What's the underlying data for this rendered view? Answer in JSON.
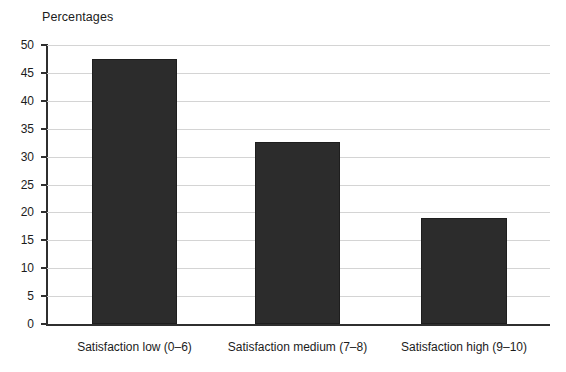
{
  "chart_data": {
    "type": "bar",
    "title": "Percentages",
    "xlabel": "",
    "ylabel": "",
    "categories": [
      "Satisfaction low (0–6)",
      "Satisfaction medium (7–8)",
      "Satisfaction high (9–10)"
    ],
    "values": [
      47.5,
      32.7,
      19.0
    ],
    "ylim": [
      0,
      50
    ],
    "yticks": [
      0,
      5,
      10,
      15,
      20,
      25,
      30,
      35,
      40,
      45,
      50
    ],
    "ytick_labels": [
      "0",
      "5",
      "10",
      "15",
      "20",
      "25",
      "30",
      "35",
      "40",
      "45",
      "50"
    ],
    "grid": true,
    "legend": false,
    "legend_position": "none",
    "bar_color": "#2c2c2c",
    "gridline_color": "#d4d4d4",
    "axis_color": "#2f2f2f",
    "background_color": "#ffffff"
  }
}
